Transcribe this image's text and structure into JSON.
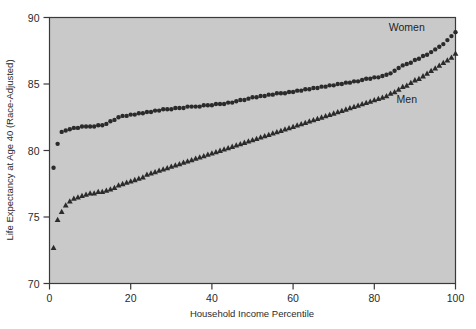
{
  "figure": {
    "background": "#ffffff",
    "plot_background": "#c9c9c9",
    "frame_color": "#3a3a3a",
    "marker_color": "#2b2b2b"
  },
  "chart_data": {
    "type": "scatter",
    "title": "",
    "xlabel": "Household Income Percentile",
    "ylabel": "Life Expectancy at Age 40 (Race-Adjusted)",
    "xlim": [
      0,
      100
    ],
    "ylim": [
      70,
      90
    ],
    "xticks": [
      0,
      20,
      40,
      60,
      80,
      100
    ],
    "yticks": [
      70,
      75,
      80,
      85,
      90
    ],
    "xtick_labels": [
      "0",
      "20",
      "40",
      "60",
      "80",
      "100"
    ],
    "ytick_labels": [
      "70",
      "75",
      "80",
      "85",
      "90"
    ],
    "grid": false,
    "legend": "inline-annotations",
    "annotations": [
      {
        "text": "Women",
        "x": 88,
        "y": 89.0
      },
      {
        "text": "Men",
        "x": 88,
        "y": 83.6
      }
    ],
    "series": [
      {
        "name": "Women",
        "marker": "circle",
        "color": "#2b2b2b",
        "x": [
          1,
          2,
          3,
          4,
          5,
          6,
          7,
          8,
          9,
          10,
          11,
          12,
          13,
          14,
          15,
          16,
          17,
          18,
          19,
          20,
          21,
          22,
          23,
          24,
          25,
          26,
          27,
          28,
          29,
          30,
          31,
          32,
          33,
          34,
          35,
          36,
          37,
          38,
          39,
          40,
          41,
          42,
          43,
          44,
          45,
          46,
          47,
          48,
          49,
          50,
          51,
          52,
          53,
          54,
          55,
          56,
          57,
          58,
          59,
          60,
          61,
          62,
          63,
          64,
          65,
          66,
          67,
          68,
          69,
          70,
          71,
          72,
          73,
          74,
          75,
          76,
          77,
          78,
          79,
          80,
          81,
          82,
          83,
          84,
          85,
          86,
          87,
          88,
          89,
          90,
          91,
          92,
          93,
          94,
          95,
          96,
          97,
          98,
          99,
          100
        ],
        "y": [
          78.7,
          80.5,
          81.4,
          81.5,
          81.6,
          81.7,
          81.7,
          81.8,
          81.8,
          81.8,
          81.8,
          81.9,
          81.9,
          82.0,
          82.2,
          82.3,
          82.5,
          82.6,
          82.6,
          82.7,
          82.7,
          82.8,
          82.8,
          82.9,
          82.9,
          83.0,
          83.0,
          83.1,
          83.1,
          83.1,
          83.2,
          83.2,
          83.2,
          83.3,
          83.3,
          83.3,
          83.3,
          83.4,
          83.4,
          83.4,
          83.5,
          83.5,
          83.5,
          83.6,
          83.6,
          83.7,
          83.8,
          83.8,
          83.9,
          84.0,
          84.0,
          84.1,
          84.1,
          84.2,
          84.2,
          84.3,
          84.3,
          84.3,
          84.4,
          84.4,
          84.5,
          84.5,
          84.6,
          84.6,
          84.7,
          84.7,
          84.8,
          84.8,
          84.9,
          84.9,
          85.0,
          85.0,
          85.1,
          85.1,
          85.2,
          85.2,
          85.3,
          85.4,
          85.4,
          85.5,
          85.5,
          85.6,
          85.7,
          85.8,
          86.0,
          86.2,
          86.4,
          86.5,
          86.6,
          86.8,
          86.9,
          87.1,
          87.2,
          87.4,
          87.6,
          87.8,
          88.0,
          88.3,
          88.6,
          88.9
        ]
      },
      {
        "name": "Men",
        "marker": "triangle",
        "color": "#2b2b2b",
        "x": [
          1,
          2,
          3,
          4,
          5,
          6,
          7,
          8,
          9,
          10,
          11,
          12,
          13,
          14,
          15,
          16,
          17,
          18,
          19,
          20,
          21,
          22,
          23,
          24,
          25,
          26,
          27,
          28,
          29,
          30,
          31,
          32,
          33,
          34,
          35,
          36,
          37,
          38,
          39,
          40,
          41,
          42,
          43,
          44,
          45,
          46,
          47,
          48,
          49,
          50,
          51,
          52,
          53,
          54,
          55,
          56,
          57,
          58,
          59,
          60,
          61,
          62,
          63,
          64,
          65,
          66,
          67,
          68,
          69,
          70,
          71,
          72,
          73,
          74,
          75,
          76,
          77,
          78,
          79,
          80,
          81,
          82,
          83,
          84,
          85,
          86,
          87,
          88,
          89,
          90,
          91,
          92,
          93,
          94,
          95,
          96,
          97,
          98,
          99,
          100
        ],
        "y": [
          72.7,
          74.8,
          75.4,
          75.9,
          76.2,
          76.4,
          76.5,
          76.6,
          76.7,
          76.8,
          76.8,
          76.9,
          76.9,
          77.0,
          77.1,
          77.2,
          77.4,
          77.5,
          77.6,
          77.7,
          77.8,
          77.9,
          78.0,
          78.2,
          78.3,
          78.4,
          78.5,
          78.6,
          78.7,
          78.8,
          78.9,
          79.0,
          79.1,
          79.2,
          79.3,
          79.4,
          79.5,
          79.6,
          79.7,
          79.8,
          79.9,
          80.0,
          80.1,
          80.2,
          80.3,
          80.4,
          80.5,
          80.6,
          80.7,
          80.8,
          80.9,
          81.0,
          81.1,
          81.2,
          81.3,
          81.4,
          81.5,
          81.6,
          81.7,
          81.8,
          81.9,
          82.0,
          82.1,
          82.2,
          82.3,
          82.4,
          82.5,
          82.6,
          82.7,
          82.8,
          82.9,
          83.0,
          83.1,
          83.2,
          83.3,
          83.4,
          83.5,
          83.6,
          83.7,
          83.8,
          83.9,
          84.0,
          84.1,
          84.3,
          84.4,
          84.6,
          84.8,
          84.9,
          85.1,
          85.3,
          85.4,
          85.6,
          85.8,
          86.0,
          86.2,
          86.4,
          86.6,
          86.8,
          87.0,
          87.3
        ]
      }
    ]
  }
}
